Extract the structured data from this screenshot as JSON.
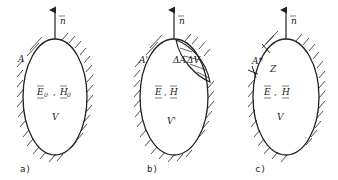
{
  "panels": [
    {
      "id": "a",
      "caption": "a)",
      "normal_label": "n",
      "surface_label": "A",
      "field_E": "E",
      "field_H": "H",
      "field_sub": "0",
      "comma": ",",
      "volume_label": "V"
    },
    {
      "id": "b",
      "caption": "b)",
      "normal_label": "n",
      "surface_label": "A'",
      "delta_area_label": "ΔA",
      "delta_volume_label": "ΔV",
      "field_E": "E",
      "field_H": "H",
      "comma": ",",
      "volume_label": "V'"
    },
    {
      "id": "c",
      "caption": "c)",
      "normal_label": "n",
      "surface_label": "A*",
      "impedance_label": "Z",
      "field_E": "E",
      "field_H": "H",
      "comma": ",",
      "volume_label": "V"
    }
  ],
  "colors": {
    "ink": "#222222",
    "background": "#ffffff"
  }
}
